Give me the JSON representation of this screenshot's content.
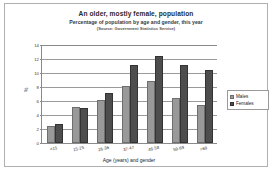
{
  "chart_data": {
    "type": "bar",
    "title": "An older, mostly female, population",
    "subtitle": "Percentage of population by age and gender, this year",
    "source": "(Source: Government Statistics Service)",
    "xlabel": "Age (years) and gender",
    "ylabel": "%",
    "categories": [
      "<15",
      "15-25",
      "26-36",
      "37-47",
      "48-58",
      "59-69",
      ">69"
    ],
    "series": [
      {
        "name": "Males",
        "color": "#999999",
        "values": [
          2.5,
          5.2,
          6.1,
          8.2,
          8.9,
          6.5,
          5.4
        ]
      },
      {
        "name": "Females",
        "color": "#4d4d4d",
        "values": [
          2.7,
          5.0,
          7.2,
          11.1,
          12.5,
          11.1,
          10.4
        ]
      }
    ],
    "ylim": [
      0,
      14
    ],
    "yticks": [
      0,
      2,
      4,
      6,
      8,
      10,
      12,
      14
    ],
    "grid": true,
    "legend_position": "right"
  }
}
